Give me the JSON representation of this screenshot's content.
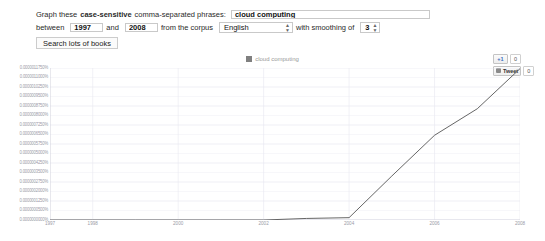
{
  "form": {
    "prompt_prefix": "Graph these",
    "prompt_bold": "case-sensitive",
    "prompt_suffix": "comma-separated phrases:",
    "phrases_value": "cloud computing",
    "phrases_placeholder": "",
    "between_label": "between",
    "start_year": "1997",
    "and_label": "and",
    "end_year": "2008",
    "corpus_label": "from the corpus",
    "corpus_value": "English",
    "smoothing_label": "with smoothing of",
    "smoothing_value": "3",
    "search_button": "Search lots of books"
  },
  "social": {
    "plusone_label": "+1",
    "plusone_count": "0",
    "tweet_label": "Tweet",
    "tweet_count": "0"
  },
  "colors": {
    "line": "#555555",
    "legend_swatch": "#808080",
    "grid": "#e8e8f0",
    "tick_text": "#9a9aa6"
  },
  "chart_data": {
    "type": "line",
    "title": "",
    "xlabel": "",
    "ylabel": "",
    "legend_position": "top-center",
    "grid": true,
    "xlim": [
      1997,
      2008
    ],
    "ylim": [
      0.0,
      1.175e-06
    ],
    "x_ticks": [
      "1997",
      "1998",
      "2000",
      "2002",
      "2004",
      "2006",
      "2008"
    ],
    "x_tick_values": [
      1997,
      1998,
      2000,
      2002,
      2004,
      2006,
      2008
    ],
    "y_ticks": [
      "0.0000011750%",
      "0.0000011000%",
      "0.0000010250%",
      "0.0000009500%",
      "0.0000008750%",
      "0.0000008000%",
      "0.0000007250%",
      "0.0000006500%",
      "0.0000005750%",
      "0.0000005000%",
      "0.0000004250%",
      "0.0000003500%",
      "0.0000002750%",
      "0.0000002000%",
      "0.0000001250%",
      "0.0000000500%",
      "0.0000000000%"
    ],
    "series": [
      {
        "name": "cloud computing",
        "color": "#555555",
        "x": [
          1997,
          1998,
          1999,
          2000,
          2001,
          2002,
          2003,
          2004,
          2005,
          2006,
          2007,
          2008
        ],
        "values": [
          0.0,
          0.0,
          0.0,
          0.0,
          0.0,
          0.0,
          1.2e-08,
          1.8e-08,
          3.4e-07,
          6.55e-07,
          8.6e-07,
          1.17e-06
        ]
      }
    ]
  }
}
